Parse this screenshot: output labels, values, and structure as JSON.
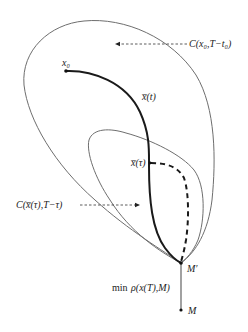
{
  "diagram": {
    "labels": {
      "outer_set": "C(x₀,T−t₀)",
      "inner_set": "C(x̅(τ),T−τ)",
      "start_point": "x₀",
      "trajectory": "x̅(t)",
      "intermediate_point": "x̅(τ)",
      "end_point": "M′",
      "target_point": "M",
      "distance_prefix": "min",
      "distance_expr": "ρ(x(T),M)"
    },
    "colors": {
      "set_boundary": "#6e6e6e",
      "trajectory": "#1a1a1a",
      "background": "#ffffff"
    }
  }
}
